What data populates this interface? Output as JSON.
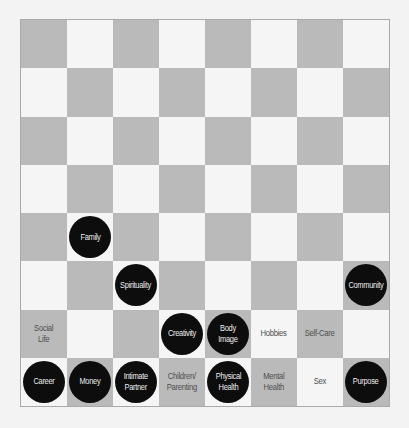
{
  "board": {
    "rows": 8,
    "cols": 8,
    "top_left_shade": "dark",
    "colors": {
      "dark_square": "#bababa",
      "light_square": "#f5f5f5",
      "piece": "#0d0d0d",
      "piece_text": "#ececec",
      "label_text": "#4e4e4e",
      "border": "#a9a9a9"
    }
  },
  "pieces": [
    {
      "row": 4,
      "col": 1,
      "label": "Family"
    },
    {
      "row": 5,
      "col": 2,
      "label": "Spirituality"
    },
    {
      "row": 5,
      "col": 7,
      "label": "Community"
    },
    {
      "row": 6,
      "col": 3,
      "label": "Creativity"
    },
    {
      "row": 6,
      "col": 4,
      "label": "Body\nImage"
    },
    {
      "row": 7,
      "col": 0,
      "label": "Career"
    },
    {
      "row": 7,
      "col": 1,
      "label": "Money"
    },
    {
      "row": 7,
      "col": 2,
      "label": "Intimate\nPartner"
    },
    {
      "row": 7,
      "col": 4,
      "label": "Physical\nHealth"
    },
    {
      "row": 7,
      "col": 7,
      "label": "Purpose"
    }
  ],
  "labels": [
    {
      "row": 6,
      "col": 0,
      "label": "Social\nLife"
    },
    {
      "row": 6,
      "col": 5,
      "label": "Hobbies"
    },
    {
      "row": 6,
      "col": 6,
      "label": "Self-Care"
    },
    {
      "row": 7,
      "col": 3,
      "label": "Children/\nParenting"
    },
    {
      "row": 7,
      "col": 5,
      "label": "Mental\nHealth"
    },
    {
      "row": 7,
      "col": 6,
      "label": "Sex"
    }
  ]
}
